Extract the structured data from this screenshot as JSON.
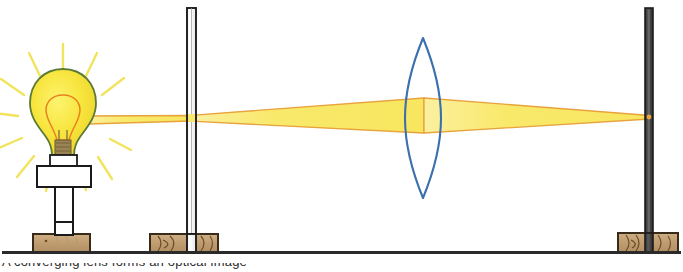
{
  "figure": {
    "background_color": "#ffffff",
    "width": 683,
    "height": 272,
    "caption_fragment": "A converging lens forms an optical image"
  },
  "palette": {
    "beam_fill": "#f9e96b",
    "beam_edge": "#e8a33d",
    "bulb_glass": "#f6e23a",
    "bulb_outline": "#5a7a35",
    "bulb_inner_outline": "#e8821e",
    "ray_color": "#f2e35c",
    "lens_outline": "#3b6fae",
    "wood_fill": "#c4a276",
    "wood_outline": "#3a2a18",
    "wood_grain": "#6b4b28",
    "post_white_fill": "#fdfdfd",
    "post_dark_fill": "#4a4a4a",
    "post_outline": "#1c1c1c",
    "holder_fill": "#ffffff",
    "holder_outline": "#1a1a1a",
    "filament_base": "#8a7446",
    "bench_line": "#2a2a2a"
  },
  "components": [
    {
      "id": "light-source",
      "label": "Light bulb source",
      "x": 63,
      "y": 120,
      "notes": "Incandescent bulb with sunburst rays, white lamp holder, wooden base"
    },
    {
      "id": "slit-aperture",
      "label": "Slit aperture on vertical post",
      "x": 193,
      "y": 120,
      "notes": "White vertical post with slit; beam passes through at beam axis"
    },
    {
      "id": "converging-lens",
      "label": "Converging (biconvex) lens",
      "x": 423,
      "y": 118,
      "notes": "Blue outlined biconvex lens, no stand drawn"
    },
    {
      "id": "screen-post",
      "label": "Screen post",
      "x": 648,
      "y": 120,
      "notes": "Dark vertical post on wooden base where beam converges to a point"
    }
  ],
  "beam": {
    "axis_y_at_source": 120,
    "axis_y_at_slit": 118,
    "axis_y_at_lens": 115,
    "axis_y_at_screen": 117,
    "half_width_at_slit": 3,
    "half_width_at_lens": 17,
    "half_width_at_screen": 1,
    "description": "Beam narrows at the slit, diverges to fill the lens, then converges to a focus point on the screen"
  },
  "rays": {
    "count": 11,
    "inner_radius": 38,
    "outer_radius": 62,
    "center_x": 63,
    "center_y": 113
  },
  "bench": {
    "y": 252,
    "x_start": 2,
    "x_end": 681,
    "label": "Optical bench surface line"
  },
  "bases": [
    {
      "id": "base-source",
      "x": 33,
      "y": 234,
      "width": 57,
      "height": 18,
      "grain": "light"
    },
    {
      "id": "base-slit",
      "x": 150,
      "y": 234,
      "width": 68,
      "height": 18,
      "grain": "heavy"
    },
    {
      "id": "base-screen",
      "x": 618,
      "y": 233,
      "width": 60,
      "height": 19,
      "grain": "heavy"
    }
  ]
}
